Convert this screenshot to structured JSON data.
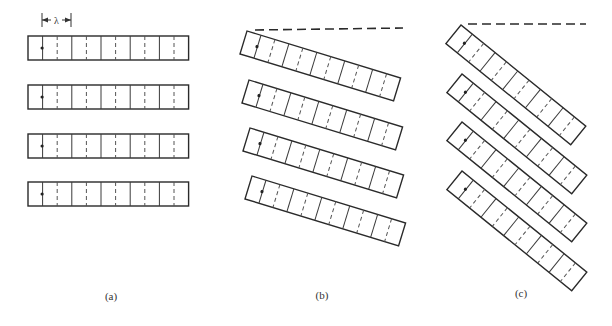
{
  "figure": {
    "array_cells": 11,
    "cell_length": 14.6,
    "array_width": 24,
    "divider_pattern": [
      "solid",
      "dashed"
    ],
    "spacing_annotation": {
      "symbol": "λ",
      "x1": 42,
      "x2": 71,
      "y": 20
    },
    "panels": [
      {
        "id": "a",
        "label": "(a)",
        "label_pos": [
          111,
          298
        ],
        "angle_deg": 0,
        "reference_line": null,
        "arrays": [
          {
            "x": 28,
            "y": 36
          },
          {
            "x": 28,
            "y": 85
          },
          {
            "x": 28,
            "y": 134
          },
          {
            "x": 28,
            "y": 182
          }
        ]
      },
      {
        "id": "b",
        "label": "(b)",
        "label_pos": [
          322,
          297
        ],
        "angle_deg": 17,
        "reference_line": {
          "x1": 255,
          "y1": 30,
          "x2": 403,
          "y2": 28
        },
        "arrays": [
          {
            "x": 247,
            "y": 31
          },
          {
            "x": 249,
            "y": 80
          },
          {
            "x": 250,
            "y": 128
          },
          {
            "x": 252,
            "y": 176
          }
        ]
      },
      {
        "id": "c",
        "label": "(c)",
        "label_pos": [
          521,
          295
        ],
        "angle_deg": 39,
        "reference_line": {
          "x1": 468,
          "y1": 24,
          "x2": 586,
          "y2": 24
        },
        "arrays": [
          {
            "x": 461,
            "y": 25
          },
          {
            "x": 462,
            "y": 74
          },
          {
            "x": 462,
            "y": 122
          },
          {
            "x": 462,
            "y": 171
          }
        ]
      }
    ]
  }
}
